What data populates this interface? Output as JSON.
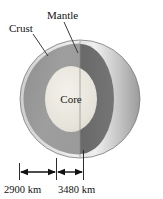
{
  "figure": {
    "labels": {
      "crust": "Crust",
      "mantle": "Mantle",
      "core": "Core"
    },
    "dimensions": [
      {
        "name": "mantle-thickness",
        "value": "2900 km"
      },
      {
        "name": "core-diameter",
        "value": "3480 km"
      }
    ],
    "colors": {
      "background": "#ffffff",
      "crust_rim": "#e8e8e8",
      "mantle_front": "#9a9a9a",
      "mantle_cut": "#6f6f6f",
      "core": "#e6e3da",
      "outer_shell_light": "#f2f2f2",
      "outer_shell_mid": "#b5b5b5",
      "outer_shell_dark": "#5f5f5f",
      "ink": "#111111"
    }
  }
}
